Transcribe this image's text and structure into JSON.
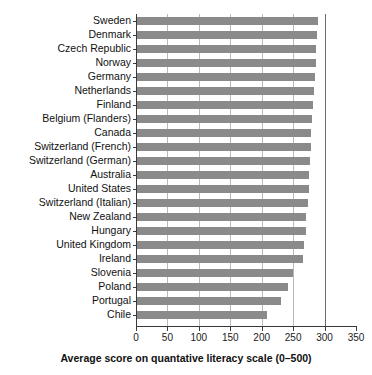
{
  "chart_data": {
    "type": "bar",
    "orientation": "horizontal",
    "title": "",
    "xlabel": "Average score on quantative literacy scale (0–500)",
    "ylabel": "",
    "xlim": [
      0,
      350
    ],
    "xticks": [
      0,
      50,
      100,
      150,
      200,
      250,
      300,
      350
    ],
    "xtick_labels": [
      "0",
      "50",
      "100",
      "150",
      "200",
      "250",
      "300",
      "350"
    ],
    "grid": true,
    "gridlines_at": [
      50,
      100,
      150,
      200,
      250,
      300
    ],
    "legend": null,
    "bar_color": "#8a8a8a",
    "categories": [
      "Sweden",
      "Denmark",
      "Czech Republic",
      "Norway",
      "Germany",
      "Netherlands",
      "Finland",
      "Belgium (Flanders)",
      "Canada",
      "Switzerland (French)",
      "Switzerland (German)",
      "Australia",
      "United States",
      "Switzerland (Italian)",
      "New Zealand",
      "Hungary",
      "United Kingdom",
      "Ireland",
      "Slovenia",
      "Poland",
      "Portugal",
      "Chile"
    ],
    "values": [
      290,
      288,
      287,
      286,
      285,
      283,
      281,
      280,
      279,
      278,
      277,
      276,
      275,
      273,
      271,
      270,
      268,
      265,
      250,
      242,
      231,
      209
    ]
  },
  "axis": {
    "title": "Average score on quantative literacy scale (0–500)"
  }
}
